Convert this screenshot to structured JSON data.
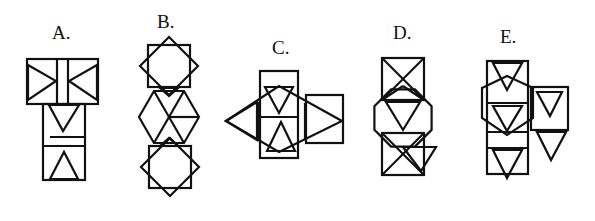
{
  "options": [
    {
      "id": "A",
      "label": "A.",
      "description": "Cube net: top rectangle with two bowtie triangles and central strip; lower column with down triangle and up triangle squares"
    },
    {
      "id": "B",
      "label": "B.",
      "description": "Star octagons (two overlapping squares) top and bottom with a hexagon divided into triangles in the middle"
    },
    {
      "id": "C",
      "label": "C.",
      "description": "Central column rectangle with down and up triangles, rhombus overlay, side triangles and right square"
    },
    {
      "id": "D",
      "label": "D.",
      "description": "Column of two squares with X diagonals, octagon with triangle in the middle, small side triangle"
    },
    {
      "id": "E",
      "label": "E.",
      "description": "Column of squares with down triangles, hexagon overlay, and side square plus triangle"
    }
  ],
  "colors": {
    "stroke": "#111111",
    "background": "#ffffff"
  }
}
